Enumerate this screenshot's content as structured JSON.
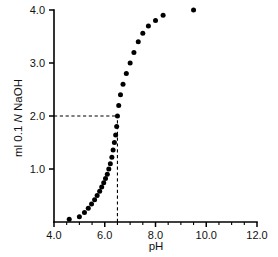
{
  "chart_data": {
    "type": "scatter",
    "title": "",
    "subtitle": "",
    "xlabel": "pH",
    "ylabel": "ml 0.1 N NaOH",
    "ylabel_parts": {
      "prefix": "ml 0.1 ",
      "italic": "N",
      "suffix": " NaOH"
    },
    "xlim": [
      4.0,
      12.0
    ],
    "ylim": [
      0.0,
      4.0
    ],
    "grid": false,
    "legend": null,
    "x_major_ticks": [
      4.0,
      6.0,
      8.0,
      10.0,
      12.0
    ],
    "x_major_tick_labels": [
      "4.0",
      "6.0",
      "8.0",
      "10.0",
      "12.0"
    ],
    "x_minor_ticks": [
      4.5,
      5.0,
      5.5,
      6.5,
      7.0,
      7.5,
      8.5,
      9.0,
      9.5,
      10.5,
      11.0,
      11.5
    ],
    "y_major_ticks": [
      1.0,
      2.0,
      3.0,
      4.0
    ],
    "y_major_tick_labels": [
      "1.0",
      "2.0",
      "3.0",
      "4.0"
    ],
    "y_minor_ticks": [],
    "series": [
      {
        "name": "titration",
        "marker": "filled-circle",
        "marker_color": "#000000",
        "x": [
          4.6,
          5.0,
          5.2,
          5.35,
          5.48,
          5.6,
          5.7,
          5.8,
          5.88,
          5.96,
          6.03,
          6.1,
          6.16,
          6.22,
          6.28,
          6.33,
          6.38,
          6.43,
          6.47,
          6.5,
          6.55,
          6.62,
          6.72,
          6.85,
          7.0,
          7.15,
          7.32,
          7.5,
          7.72,
          8.0,
          8.3,
          9.5
        ],
        "y": [
          0.05,
          0.1,
          0.18,
          0.26,
          0.34,
          0.42,
          0.5,
          0.58,
          0.66,
          0.74,
          0.82,
          0.9,
          1.0,
          1.1,
          1.22,
          1.36,
          1.5,
          1.64,
          1.8,
          2.0,
          2.2,
          2.4,
          2.6,
          2.8,
          3.0,
          3.2,
          3.4,
          3.56,
          3.7,
          3.8,
          3.9,
          4.0
        ]
      }
    ],
    "annotations": [
      {
        "name": "half-equivalence-guide-horizontal",
        "type": "dashed-line",
        "orientation": "horizontal",
        "value": 2.0,
        "from_x": 4.0,
        "to_x": 6.5
      },
      {
        "name": "half-equivalence-guide-vertical",
        "type": "dashed-line",
        "orientation": "vertical",
        "value": 6.5,
        "from_y": 0.0,
        "to_y": 2.0
      }
    ]
  },
  "axes": {
    "x_title": "pH",
    "y_title_prefix": "ml 0.1 ",
    "y_title_italic": "N",
    "y_title_suffix": " NaOH"
  },
  "colors": {
    "background": "#ffffff",
    "foreground": "#000000",
    "marker": "#000000"
  }
}
